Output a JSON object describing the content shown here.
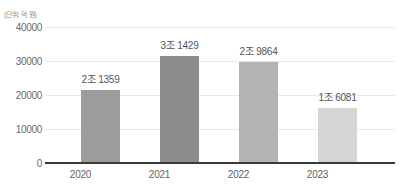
{
  "chart_data": {
    "type": "bar",
    "title": "",
    "subtitle": "",
    "unit_note": "(단위: 억 원)",
    "xlabel": "",
    "ylabel": "",
    "categories": [
      "2020",
      "2021",
      "2022",
      "2023"
    ],
    "values": [
      21359,
      31429,
      29864,
      16081
    ],
    "data_labels": [
      "2조 1359",
      "3조 1429",
      "2조 9864",
      "1조 6081"
    ],
    "series": [
      {
        "name": "금액",
        "values": [
          21359,
          31429,
          29864,
          16081
        ]
      }
    ],
    "ylim": [
      0,
      40000
    ],
    "yticks": [
      0,
      10000,
      20000,
      30000,
      40000
    ],
    "ytick_labels": [
      "0",
      "10000",
      "20000",
      "30000",
      "40000"
    ],
    "grid": true,
    "grid_axis": "y",
    "legend": false,
    "legend_position": "none",
    "bar_colors": [
      "#9c9c9c",
      "#8d8d8d",
      "#b3b3b3",
      "#d5d5d5"
    ],
    "axis_color": "#3a3a3a",
    "gridline_color": "#e8e8e8",
    "label_color": "#555555",
    "background": "#ffffff"
  }
}
